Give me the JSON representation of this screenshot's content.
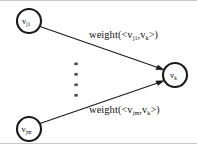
{
  "figure": {
    "type": "directed-graph",
    "background_color": "#ffffff",
    "stroke_color": "#1a1a1a",
    "frame_color": "#b9b9b9"
  },
  "nodes": [
    {
      "id": "vj1",
      "symbol": "v",
      "subscript": "j1",
      "role": "source-node-first",
      "cx": 29,
      "cy": 21,
      "r": 12
    },
    {
      "id": "vjm",
      "symbol": "v",
      "subscript": "jm",
      "role": "source-node-last",
      "cx": 29,
      "cy": 129,
      "r": 12
    },
    {
      "id": "vk",
      "symbol": "v",
      "subscript": "k",
      "role": "target-node",
      "cx": 175,
      "cy": 75,
      "r": 12
    }
  ],
  "edges": [
    {
      "id": "edge-vj1-vk",
      "from": "vj1",
      "to": "vk",
      "label": {
        "function": "weight",
        "open": "(<",
        "source": "v",
        "source_sub": "j1",
        "comma": ",",
        "target": "v",
        "target_sub": "k",
        "close": ">)",
        "full_text": "weight(<v_j1,v_k>)"
      }
    },
    {
      "id": "edge-vjm-vk",
      "from": "vjm",
      "to": "vk",
      "label": {
        "function": "weight",
        "open": "(<",
        "source": "v",
        "source_sub": "jm",
        "comma": ",",
        "target": "v",
        "target_sub": "k",
        "close": ">)",
        "full_text": "weight(<v_jm,v_k>)"
      }
    }
  ],
  "ellipsis": {
    "id": "vertical-ellipsis",
    "meaning": "additional-source-nodes-omitted",
    "glyph": "vertical-dots",
    "dot_count": 4,
    "x": 76,
    "y_start": 63,
    "y_end": 95
  }
}
